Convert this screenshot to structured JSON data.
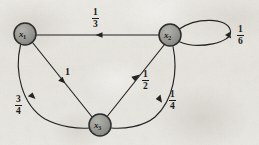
{
  "figure": {
    "kind": "markov-chain-state-transition-diagram",
    "background_color": "#e8e6e0",
    "ink_color": "#1b1b1b",
    "node_fill": "#9a9a95",
    "node_stroke": "#2b2b2b"
  },
  "nodes": [
    {
      "id": "x1",
      "base": "x",
      "subscript": "1",
      "cx": 25,
      "cy": 34,
      "r": 11
    },
    {
      "id": "x2",
      "base": "x",
      "subscript": "2",
      "cx": 170,
      "cy": 35,
      "r": 11
    },
    {
      "id": "x3",
      "base": "x",
      "subscript": "3",
      "cx": 100,
      "cy": 125,
      "r": 11
    }
  ],
  "edges": [
    {
      "id": "e-x2-x1",
      "from": "x2",
      "to": "x1",
      "shape": "straight-horizontal",
      "label": {
        "type": "fraction",
        "numerator": "1",
        "denominator": "3",
        "text": "1/3",
        "x": 97,
        "y": 10
      },
      "arrow_at": {
        "x": 99,
        "y": 35
      },
      "arrow_direction": "left"
    },
    {
      "id": "e-x2-x2-selfloop",
      "from": "x2",
      "to": "x2",
      "shape": "self-loop-right",
      "label": {
        "type": "fraction",
        "numerator": "1",
        "denominator": "6",
        "text": "1/6",
        "x": 240,
        "y": 27
      },
      "arrow_at": {
        "x": 228,
        "y": 40
      },
      "arrow_direction": "down-left"
    },
    {
      "id": "e-x1-x3-straight",
      "from": "x1",
      "to": "x3",
      "shape": "straight-diagonal",
      "label": {
        "type": "whole",
        "text": "1",
        "x": 67,
        "y": 70
      },
      "arrow_at": {
        "x": 62,
        "y": 78
      },
      "arrow_direction": "down-right"
    },
    {
      "id": "e-x1-x3-curve",
      "from": "x1",
      "to": "x3",
      "shape": "curve-bulge-left",
      "label": {
        "type": "fraction",
        "numerator": "3",
        "denominator": "4",
        "text": "3/4",
        "x": 18,
        "y": 98
      },
      "arrow_at": {
        "x": 34,
        "y": 95
      },
      "arrow_direction": "down"
    },
    {
      "id": "e-x3-x2-straight",
      "from": "x3",
      "to": "x2",
      "shape": "straight-diagonal",
      "label": {
        "type": "fraction",
        "numerator": "1",
        "denominator": "2",
        "text": "1/2",
        "x": 145,
        "y": 73
      },
      "arrow_at": {
        "x": 138,
        "y": 78
      },
      "arrow_direction": "up-right"
    },
    {
      "id": "e-x2-x3-curve",
      "from": "x2",
      "to": "x3",
      "shape": "curve-bulge-right",
      "label": {
        "type": "fraction",
        "numerator": "1",
        "denominator": "4",
        "text": "1/4",
        "x": 172,
        "y": 93
      },
      "arrow_at": {
        "x": 157,
        "y": 89
      },
      "arrow_direction": "down-left"
    }
  ],
  "labels": {
    "node_x1": {
      "base": "x",
      "sub": "1"
    },
    "node_x2": {
      "base": "x",
      "sub": "2"
    },
    "node_x3": {
      "base": "x",
      "sub": "3"
    },
    "edge_1_3_num": "1",
    "edge_1_3_den": "3",
    "edge_1_6_num": "1",
    "edge_1_6_den": "6",
    "edge_3_4_num": "3",
    "edge_3_4_den": "4",
    "edge_1_2_num": "1",
    "edge_1_2_den": "2",
    "edge_1_4_num": "1",
    "edge_1_4_den": "4",
    "edge_1_whole": "1"
  }
}
